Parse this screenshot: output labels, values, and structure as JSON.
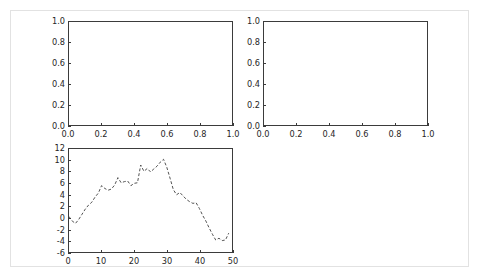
{
  "figure": {
    "width": 480,
    "height": 279,
    "background_color": "#ffffff",
    "border_color": "#e2e2e2",
    "axis_color": "#3b3b3b",
    "tick_label_color": "#262626",
    "line_color": "#3b3b3b"
  },
  "chart_data": [
    {
      "id": "top-left",
      "type": "line",
      "title": "",
      "xlabel": "",
      "ylabel": "",
      "xlim": [
        0.0,
        1.0
      ],
      "ylim": [
        0.0,
        1.0
      ],
      "xticks": [
        0.0,
        0.2,
        0.4,
        0.6,
        0.8,
        1.0
      ],
      "yticks": [
        0.0,
        0.2,
        0.4,
        0.6,
        0.8,
        1.0
      ],
      "xticklabels": [
        "0.0",
        "0.2",
        "0.4",
        "0.6",
        "0.8",
        "1.0"
      ],
      "yticklabels": [
        "0.0",
        "0.2",
        "0.4",
        "0.6",
        "0.8",
        "1.0"
      ],
      "grid": false,
      "legend": null,
      "series": [],
      "x": [],
      "values": []
    },
    {
      "id": "top-right",
      "type": "line",
      "title": "",
      "xlabel": "",
      "ylabel": "",
      "xlim": [
        0.0,
        1.0
      ],
      "ylim": [
        0.0,
        1.0
      ],
      "xticks": [
        0.0,
        0.2,
        0.4,
        0.6,
        0.8,
        1.0
      ],
      "yticks": [
        0.0,
        0.2,
        0.4,
        0.6,
        0.8,
        1.0
      ],
      "xticklabels": [
        "0.0",
        "0.2",
        "0.4",
        "0.6",
        "0.8",
        "1.0"
      ],
      "yticklabels": [
        "0.0",
        "0.2",
        "0.4",
        "0.6",
        "0.8",
        "1.0"
      ],
      "grid": false,
      "legend": null,
      "series": [],
      "x": [],
      "values": []
    },
    {
      "id": "bottom-left",
      "type": "line",
      "title": "",
      "xlabel": "",
      "ylabel": "",
      "xlim": [
        0,
        50
      ],
      "ylim": [
        -6,
        12
      ],
      "xticks": [
        0,
        10,
        20,
        30,
        40,
        50
      ],
      "yticks": [
        -6,
        -4,
        -2,
        0,
        2,
        4,
        6,
        8,
        10,
        12
      ],
      "xticklabels": [
        "0",
        "10",
        "20",
        "30",
        "40",
        "50"
      ],
      "yticklabels": [
        "-6",
        "-4",
        "-2",
        "0",
        "2",
        "4",
        "6",
        "8",
        "10",
        "12"
      ],
      "grid": false,
      "legend": null,
      "linestyle": "dashed",
      "x": [
        0,
        1,
        2,
        3,
        4,
        5,
        6,
        7,
        8,
        9,
        10,
        11,
        12,
        13,
        14,
        15,
        16,
        17,
        18,
        19,
        20,
        21,
        22,
        23,
        24,
        25,
        26,
        27,
        28,
        29,
        30,
        31,
        32,
        33,
        34,
        35,
        36,
        37,
        38,
        39,
        40,
        41,
        42,
        43,
        44,
        45,
        46,
        47,
        48,
        49
      ],
      "values": [
        0.2,
        -0.6,
        -1.0,
        -0.3,
        0.6,
        1.5,
        2.2,
        2.7,
        3.6,
        4.3,
        5.6,
        5.1,
        4.8,
        5.0,
        5.7,
        7.0,
        6.1,
        6.3,
        6.4,
        5.6,
        6.0,
        6.1,
        9.2,
        8.1,
        8.6,
        8.0,
        8.5,
        9.0,
        9.7,
        10.2,
        8.8,
        6.9,
        4.9,
        4.0,
        4.4,
        3.8,
        3.2,
        2.8,
        2.5,
        2.6,
        1.6,
        0.4,
        -0.6,
        -1.8,
        -2.9,
        -3.9,
        -3.6,
        -4.0,
        -3.9,
        -2.7
      ]
    }
  ]
}
